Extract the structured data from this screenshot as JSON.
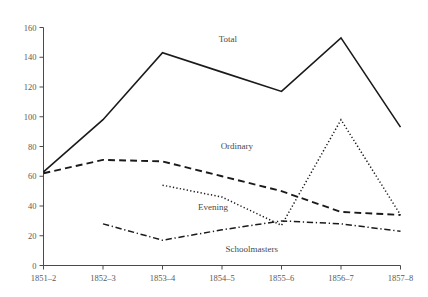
{
  "chart_data": {
    "type": "line",
    "title": "",
    "subtitle": "",
    "xlabel": "",
    "ylabel": "",
    "categories": [
      "1851–2",
      "1852–3",
      "1853–4",
      "1854–5",
      "1855–6",
      "1856–7",
      "1857–8"
    ],
    "yticks": [
      0,
      20,
      40,
      60,
      80,
      100,
      120,
      140,
      160
    ],
    "ylim": [
      0,
      160
    ],
    "grid": false,
    "legend_position": "inline-annotations",
    "series": [
      {
        "name": "Total",
        "style": "solid",
        "color": "#1a1a1a",
        "stroke_width": 1.6,
        "values": [
          63,
          98,
          143,
          130,
          117,
          153,
          93
        ],
        "label": "Total"
      },
      {
        "name": "Ordinary",
        "style": "dashed",
        "color": "#1a1a1a",
        "stroke_width": 1.9,
        "values": [
          62,
          71,
          70,
          60,
          50,
          36,
          34
        ],
        "label": "Ordinary"
      },
      {
        "name": "Evening",
        "style": "dotted",
        "color": "#1a1a1a",
        "stroke_width": 1.5,
        "values": [
          null,
          null,
          54,
          46,
          27,
          98,
          34
        ],
        "label": "Evening"
      },
      {
        "name": "Schoolmasters",
        "style": "dashdot",
        "color": "#1a1a1a",
        "stroke_width": 1.5,
        "values": [
          null,
          28,
          17,
          24,
          30,
          28,
          23
        ],
        "label": "Schoolmasters"
      }
    ],
    "annotations": [
      {
        "text": "Total",
        "x_value": 3.1,
        "y_value": 150
      },
      {
        "text": "Ordinary",
        "x_value": 3.25,
        "y_value": 78
      },
      {
        "text": "Evening",
        "x_value": 2.85,
        "y_value": 37
      },
      {
        "text": "Schoolmasters",
        "x_value": 3.5,
        "y_value": 9
      }
    ]
  }
}
